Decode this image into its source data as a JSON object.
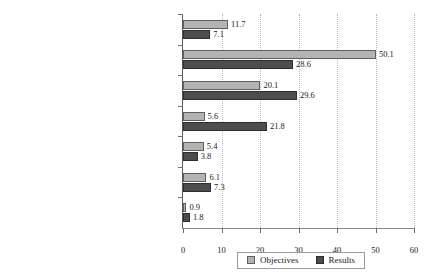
{
  "chart_data": {
    "type": "bar",
    "orientation": "horizontal",
    "title": "",
    "xlabel": "",
    "ylabel": "",
    "xlim": [
      0,
      60
    ],
    "xticks": [
      0,
      10,
      20,
      30,
      40,
      50,
      60
    ],
    "grid": "vertical-dotted",
    "legend_position": "bottom-center",
    "categories": [
      "Protect personal and family health",
      "Encourage environmentally\nresponsible lifestyles",
      "Support local producers",
      "Provide opportunties to build social ties",
      "Facilitate networking to\ninfluence public policies",
      "Lower the cost of quality products",
      "n.a."
    ],
    "series": [
      {
        "name": "Objectives",
        "color": "#b3b3b3",
        "values": [
          11.7,
          50.1,
          20.1,
          5.6,
          5.4,
          6.1,
          0.9
        ],
        "labels": [
          "11.7",
          "50.1",
          "20.1",
          "5.6",
          "5.4",
          "6.1",
          "0.9"
        ]
      },
      {
        "name": "Results",
        "color": "#4d4d4d",
        "values": [
          7.1,
          28.6,
          29.6,
          21.8,
          3.8,
          7.3,
          1.8
        ],
        "labels": [
          "7.1",
          "28.6",
          "29.6",
          "21.8",
          "3.8",
          "7.3",
          "1.8"
        ]
      }
    ]
  },
  "legend": {
    "items": [
      {
        "label": "Objectives",
        "color": "#b3b3b3"
      },
      {
        "label": "Results",
        "color": "#4d4d4d"
      }
    ]
  }
}
